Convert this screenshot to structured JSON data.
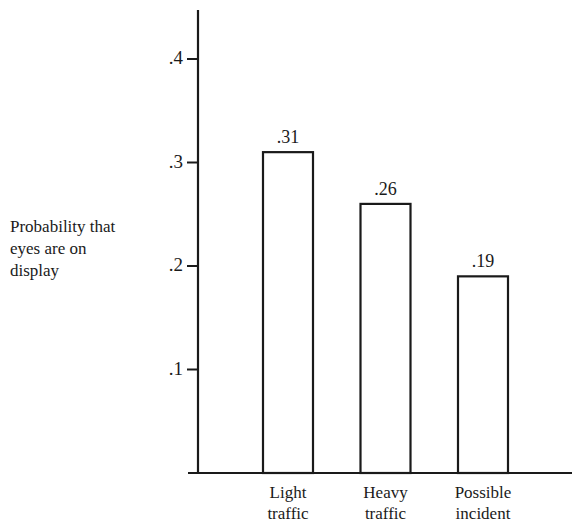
{
  "chart_data": {
    "type": "bar",
    "title": "",
    "xlabel": "",
    "ylabel": "Probability that eyes are on display",
    "ylabel_lines": [
      "Probability that",
      "eyes are on",
      "display"
    ],
    "categories": [
      "Light traffic",
      "Heavy traffic",
      "Possible incident"
    ],
    "category_lines": [
      [
        "Light",
        "traffic"
      ],
      [
        "Heavy",
        "traffic"
      ],
      [
        "Possible",
        "incident"
      ]
    ],
    "values": [
      0.31,
      0.26,
      0.19
    ],
    "value_labels": [
      ".31",
      ".26",
      ".19"
    ],
    "yticks": [
      0.1,
      0.2,
      0.3,
      0.4
    ],
    "ytick_labels": [
      ".1",
      ".2",
      ".3",
      ".4"
    ],
    "ylim": [
      0,
      0.44
    ],
    "grid": false,
    "legend": null,
    "bar_fill": "#ffffff",
    "bar_stroke": "#1a1a1a"
  }
}
